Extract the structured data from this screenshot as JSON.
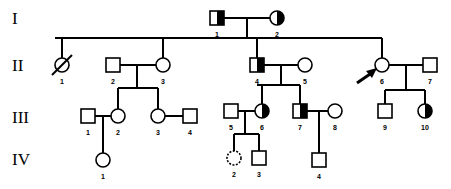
{
  "generations": [
    {
      "label": "I",
      "y": 18
    },
    {
      "label": "II",
      "y": 65
    },
    {
      "label": "III",
      "y": 117
    },
    {
      "label": "IV",
      "y": 159
    }
  ],
  "individuals": [
    {
      "id": "I-1",
      "num": "1",
      "sex": "male",
      "affect": "half-right",
      "x": 217,
      "y": 18
    },
    {
      "id": "I-2",
      "num": "2",
      "sex": "female",
      "affect": "half-right",
      "x": 277,
      "y": 18
    },
    {
      "id": "II-1",
      "num": "1",
      "sex": "female",
      "affect": "deceased",
      "x": 62,
      "y": 65
    },
    {
      "id": "II-2",
      "num": "2",
      "sex": "male",
      "affect": "none",
      "x": 113,
      "y": 65
    },
    {
      "id": "II-3",
      "num": "3",
      "sex": "female",
      "affect": "none",
      "x": 163,
      "y": 65
    },
    {
      "id": "II-4",
      "num": "4",
      "sex": "male",
      "affect": "half-right",
      "x": 257,
      "y": 65
    },
    {
      "id": "II-5",
      "num": "5",
      "sex": "female",
      "affect": "none",
      "x": 305,
      "y": 65
    },
    {
      "id": "II-6",
      "num": "6",
      "sex": "female",
      "affect": "full",
      "x": 382,
      "y": 65,
      "proband": true
    },
    {
      "id": "II-7",
      "num": "7",
      "sex": "male",
      "affect": "none",
      "x": 430,
      "y": 65
    },
    {
      "id": "III-1",
      "num": "1",
      "sex": "male",
      "affect": "none",
      "x": 88,
      "y": 116
    },
    {
      "id": "III-2",
      "num": "2",
      "sex": "female",
      "affect": "none",
      "x": 118,
      "y": 116
    },
    {
      "id": "III-3",
      "num": "3",
      "sex": "female",
      "affect": "none",
      "x": 158,
      "y": 116
    },
    {
      "id": "III-4",
      "num": "4",
      "sex": "male",
      "affect": "none",
      "x": 190,
      "y": 116
    },
    {
      "id": "III-5",
      "num": "5",
      "sex": "male",
      "affect": "none",
      "x": 231,
      "y": 111
    },
    {
      "id": "III-6",
      "num": "6",
      "sex": "female",
      "affect": "half-right",
      "x": 262,
      "y": 111
    },
    {
      "id": "III-7",
      "num": "7",
      "sex": "male",
      "affect": "half-right",
      "x": 300,
      "y": 111
    },
    {
      "id": "III-8",
      "num": "8",
      "sex": "female",
      "affect": "none",
      "x": 335,
      "y": 111
    },
    {
      "id": "III-9",
      "num": "9",
      "sex": "male",
      "affect": "none",
      "x": 385,
      "y": 111
    },
    {
      "id": "III-10",
      "num": "10",
      "sex": "female",
      "affect": "half-right",
      "x": 425,
      "y": 111
    },
    {
      "id": "IV-1",
      "num": "1",
      "sex": "female",
      "affect": "none",
      "x": 103,
      "y": 160
    },
    {
      "id": "IV-2",
      "num": "2",
      "sex": "female",
      "affect": "dotted",
      "x": 234,
      "y": 158
    },
    {
      "id": "IV-3",
      "num": "3",
      "sex": "male",
      "affect": "none",
      "x": 259,
      "y": 158
    },
    {
      "id": "IV-4",
      "num": "4",
      "sex": "male",
      "affect": "none",
      "x": 319,
      "y": 160
    }
  ],
  "lines": [
    [
      224,
      18,
      270,
      18
    ],
    [
      247,
      18,
      247,
      38
    ],
    [
      55,
      38,
      382,
      38
    ],
    [
      62,
      38,
      62,
      58
    ],
    [
      163,
      38,
      163,
      58
    ],
    [
      257,
      38,
      257,
      58
    ],
    [
      382,
      38,
      382,
      58
    ],
    [
      120,
      65,
      156,
      65
    ],
    [
      137,
      65,
      137,
      88
    ],
    [
      118,
      88,
      158,
      88
    ],
    [
      118,
      88,
      118,
      109
    ],
    [
      158,
      88,
      158,
      109
    ],
    [
      264,
      65,
      298,
      65
    ],
    [
      281,
      65,
      281,
      85
    ],
    [
      257,
      85,
      300,
      85
    ],
    [
      257,
      85,
      262,
      85
    ],
    [
      262,
      85,
      262,
      104
    ],
    [
      300,
      85,
      300,
      104
    ],
    [
      389,
      65,
      423,
      65
    ],
    [
      406,
      65,
      406,
      90
    ],
    [
      385,
      90,
      425,
      90
    ],
    [
      385,
      90,
      385,
      104
    ],
    [
      425,
      90,
      425,
      104
    ],
    [
      95,
      116,
      111,
      116
    ],
    [
      103,
      116,
      103,
      153
    ],
    [
      165,
      116,
      183,
      116
    ],
    [
      238,
      111,
      255,
      111
    ],
    [
      245,
      111,
      245,
      134
    ],
    [
      234,
      134,
      259,
      134
    ],
    [
      234,
      134,
      234,
      151
    ],
    [
      259,
      134,
      259,
      151
    ],
    [
      307,
      111,
      328,
      111
    ],
    [
      319,
      111,
      319,
      153
    ]
  ],
  "arrow": {
    "target": "II-6",
    "label": "proband-arrow"
  }
}
